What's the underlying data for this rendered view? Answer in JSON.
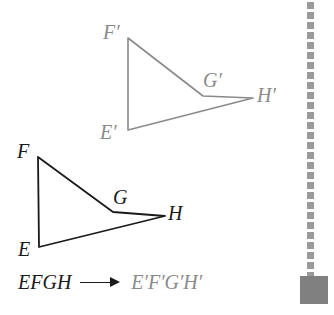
{
  "diagram": {
    "preimage": {
      "name": "EFGH",
      "color": "#1a1a1a",
      "vertices": [
        {
          "label": "E",
          "x": 39,
          "y": 247,
          "label_x": 18,
          "label_y": 239
        },
        {
          "label": "F",
          "x": 38,
          "y": 157,
          "label_x": 17,
          "label_y": 141
        },
        {
          "label": "G",
          "x": 113,
          "y": 212,
          "label_x": 113,
          "label_y": 187
        },
        {
          "label": "H",
          "x": 165,
          "y": 216,
          "label_x": 168,
          "label_y": 203
        }
      ]
    },
    "image": {
      "name": "E'F'G'H'",
      "color": "#8a8a8a",
      "vertices": [
        {
          "label": "E′",
          "x": 128,
          "y": 130,
          "label_x": 100,
          "label_y": 122
        },
        {
          "label": "F′",
          "x": 128,
          "y": 38,
          "label_x": 103,
          "label_y": 22
        },
        {
          "label": "G′",
          "x": 203,
          "y": 96,
          "label_x": 203,
          "label_y": 70
        },
        {
          "label": "H′",
          "x": 253,
          "y": 98,
          "label_x": 257,
          "label_y": 85
        }
      ]
    }
  },
  "mapping": {
    "source_label": "EFGH",
    "arrow": "arrow-right-icon",
    "destination_label": "E′F′G′H′"
  },
  "chrome": {
    "dotted_rail": {
      "name": "dotted-rail",
      "dot_color": "#9a9a9a",
      "dot_size": 7,
      "dot_spacing": 10,
      "x": 307
    },
    "corner_swatch": {
      "name": "corner-swatch",
      "color": "#808080",
      "x": 300,
      "y": 276,
      "size": 28
    }
  },
  "canvas": {
    "width": 334,
    "height": 315,
    "background": "#ffffff"
  }
}
